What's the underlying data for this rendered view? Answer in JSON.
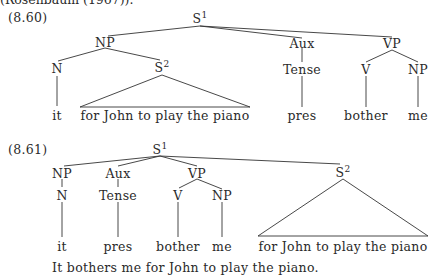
{
  "header_fragment": "(Rosenbaum (1967)).",
  "examples": [
    {
      "label": "(8.60)",
      "nodes": {
        "root": {
          "cat": "S",
          "idx": "1"
        },
        "np": "NP",
        "aux": "Aux",
        "vp": "VP",
        "n": "N",
        "s2": {
          "cat": "S",
          "idx": "2"
        },
        "tense": "Tense",
        "v": "V",
        "np2": "NP"
      },
      "leaves": {
        "it": "it",
        "clause": "for John to play the piano",
        "pres": "pres",
        "bother": "bother",
        "me": "me"
      }
    },
    {
      "label": "(8.61)",
      "nodes": {
        "root": {
          "cat": "S",
          "idx": "1"
        },
        "np": "NP",
        "aux": "Aux",
        "vp": "VP",
        "s2": {
          "cat": "S",
          "idx": "2"
        },
        "n": "N",
        "tense": "Tense",
        "v": "V",
        "np2": "NP"
      },
      "leaves": {
        "it": "it",
        "pres": "pres",
        "bother": "bother",
        "me": "me",
        "clause": "for John to play the piano"
      },
      "sentence": "It bothers me for John to play the piano."
    }
  ]
}
